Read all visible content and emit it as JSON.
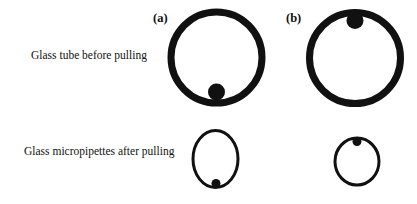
{
  "rows": [
    {
      "label": "Glass tube before pulling"
    },
    {
      "label": "Glass micropipettes after pulling"
    }
  ],
  "panels": [
    {
      "label": "(a)"
    },
    {
      "label": "(b)"
    }
  ],
  "colors": {
    "stroke": "#111111",
    "background": "#ffffff"
  }
}
